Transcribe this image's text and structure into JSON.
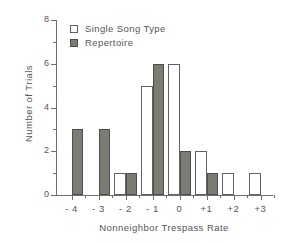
{
  "chart_data": {
    "type": "bar",
    "title": "",
    "xlabel": "Nonneighbor Trespass Rate",
    "ylabel": "Number of Trials",
    "categories": [
      "- 4",
      "- 3",
      "- 2",
      "- 1",
      "0",
      "+1",
      "+2",
      "+3"
    ],
    "series": [
      {
        "name": "Single Song Type",
        "style": "open",
        "color": "#ffffff",
        "edge": "#636363",
        "values": [
          0,
          0,
          1,
          5,
          6,
          2,
          1,
          1
        ]
      },
      {
        "name": "Repertoire",
        "style": "filled",
        "color": "#7c7c74",
        "edge": "#4f4f4a",
        "values": [
          3,
          3,
          1,
          6,
          2,
          1,
          0,
          0
        ]
      }
    ],
    "ylim": [
      0,
      8
    ],
    "yticks": [
      0,
      2,
      4,
      6,
      8
    ],
    "yticks_minor": [
      1,
      3,
      5,
      7
    ],
    "ytick_labels": [
      "0",
      "2",
      "4",
      "6",
      "8"
    ],
    "grid": false,
    "legend_position": "top-left-inside"
  },
  "legend": {
    "items": [
      {
        "label": "Single Song Type",
        "swatch": "open-square"
      },
      {
        "label": "Repertoire",
        "swatch": "filled-square"
      }
    ]
  },
  "axes": {
    "x_title": "Nonneighbor Trespass Rate",
    "y_title": "Number of Trials"
  }
}
